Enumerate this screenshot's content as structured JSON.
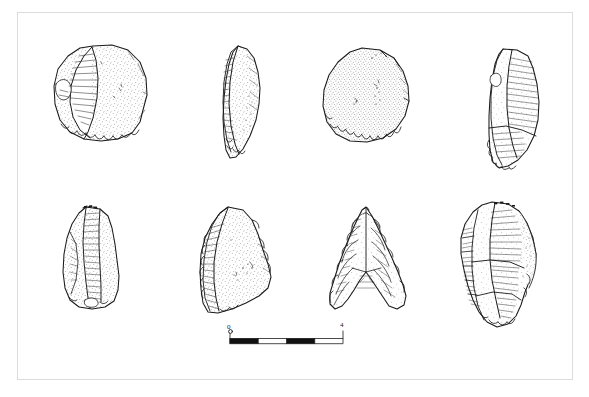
{
  "plate": {
    "title": "Lithic artefact plate",
    "caption": "",
    "background_color": "#ffffff",
    "frame_color": "#dcdcdc",
    "ink_color": "#1a1a1a",
    "rows": 2,
    "columns": 4
  },
  "artifacts": [
    {
      "id": "artifact-1",
      "position": "row-1-col-1",
      "name": "Side scraper, dorsal view",
      "description": "Broad sub-circular flake with stippled dorsal surface, large removal scar on left, denticulate retouch along lower edge"
    },
    {
      "id": "artifact-2",
      "position": "row-1-col-2",
      "name": "Side scraper, lateral profile view",
      "description": "Narrow elongated profile of the scraper showing steep retouched edge and stippled cortex"
    },
    {
      "id": "artifact-3",
      "position": "row-1-col-3",
      "name": "Discoidal scraper, dorsal view",
      "description": "Rounded discoidal piece with dense overall stipple and continuous retouch along the lower margin"
    },
    {
      "id": "artifact-4",
      "position": "row-1-col-4",
      "name": "End scraper, dorsal view",
      "description": "Elongated flake with long parallel flake scars and retouch at the distal end"
    },
    {
      "id": "artifact-5",
      "position": "row-2-col-1",
      "name": "Core / blade fragment, dorsal view",
      "description": "Sub-rectangular piece with multiple parallel removal scars and stippled margins"
    },
    {
      "id": "artifact-6",
      "position": "row-2-col-2",
      "name": "Convergent scraper, dorsal view",
      "description": "Triangular flake with stippled right face, long removal scar on left and retouched lateral edge"
    },
    {
      "id": "artifact-7",
      "position": "row-2-col-3",
      "name": "Concave-base projectile point (arrowhead)",
      "description": "Bifacially flaked hollow-based triangular point with deeply notched base and fine pressure flaking"
    },
    {
      "id": "artifact-8",
      "position": "row-2-col-4",
      "name": "Multi-platform core, dorsal view",
      "description": "Blocky core with numerous flake scars on the left face and stippled cortex on the right"
    }
  ],
  "scale_bar": {
    "name": "scale-bar",
    "start_label": "0",
    "end_label": "4",
    "unit": "cm",
    "segments": 4,
    "segment_fill_pattern": [
      "filled",
      "open",
      "filled",
      "open"
    ],
    "length_px": 113
  }
}
